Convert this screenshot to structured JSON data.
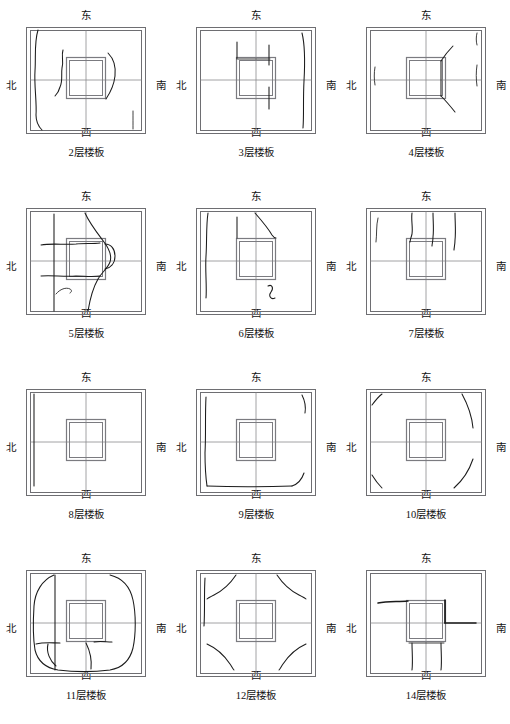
{
  "figure": {
    "type": "floor-slab-crack-diagram-grid",
    "columns": 3,
    "rows": 4,
    "directions": {
      "north_top": "东",
      "south_bottom": "西",
      "west_left": "北",
      "east_right": "南"
    }
  },
  "panels": [
    {
      "id": "panel-2",
      "caption": "2层楼板",
      "floor": 2,
      "direction_top": "东",
      "direction_bottom": "西",
      "direction_left": "北",
      "direction_right": "南",
      "crack_description": "Long wavy crack along north (left) edge, short vertical cracks above and below core, curved crack on south (right) side of core, short mark near bottom-right"
    },
    {
      "id": "panel-3",
      "caption": "3层楼板",
      "floor": 3,
      "direction_top": "东",
      "direction_bottom": "西",
      "direction_left": "北",
      "direction_right": "南",
      "crack_description": "Two straight vertical cracks above core, one vertical crack below core extending south, thin crack along east (right) edge"
    },
    {
      "id": "panel-4",
      "caption": "4层楼板",
      "floor": 4,
      "direction_top": "东",
      "direction_bottom": "西",
      "direction_left": "北",
      "direction_right": "南",
      "crack_description": "Diagonal cracks radiating from the southeast corner of the core toward top-right and bottom-right; faint vertical marks on left and right edges"
    },
    {
      "id": "panel-5",
      "caption": "5层楼板",
      "floor": 5,
      "direction_top": "东",
      "direction_bottom": "西",
      "direction_left": "北",
      "direction_right": "南",
      "crack_description": "Heavy cracking: long diagonal crack from top center sweeping around the east side of the core down to the bottom, horizontal cracks crossing the north half, hooked crack in lower-left quadrant"
    },
    {
      "id": "panel-6",
      "caption": "6层楼板",
      "floor": 6,
      "direction_top": "东",
      "direction_bottom": "西",
      "direction_left": "北",
      "direction_right": "南",
      "crack_description": "Vertical crack above core, curved diagonal crack from top center to core corner, vertical crack along west (left) edge, S-shaped crack below core"
    },
    {
      "id": "panel-7",
      "caption": "7层楼板",
      "floor": 7,
      "direction_top": "东",
      "direction_bottom": "西",
      "direction_left": "北",
      "direction_right": "南",
      "crack_description": "Three near-vertical cracks descending from the top edge into the upper half; thin crack along left edge"
    },
    {
      "id": "panel-8",
      "caption": "8层楼板",
      "floor": 8,
      "direction_top": "东",
      "direction_bottom": "西",
      "direction_left": "北",
      "direction_right": "南",
      "crack_description": "Essentially undamaged; only a thin vertical crack along the north (left) edge"
    },
    {
      "id": "panel-9",
      "caption": "9层楼板",
      "floor": 9,
      "direction_top": "东",
      "direction_bottom": "西",
      "direction_left": "北",
      "direction_right": "南",
      "crack_description": "Light perimeter cracking just inside all four edges, with small arcs at the right corners"
    },
    {
      "id": "panel-10",
      "caption": "10层楼板",
      "floor": 10,
      "direction_top": "东",
      "direction_bottom": "西",
      "direction_left": "北",
      "direction_right": "南",
      "crack_description": "Arc-shaped corner cracks at all four corners, the south (right) arcs being longest"
    },
    {
      "id": "panel-11",
      "caption": "11层楼板",
      "floor": 11,
      "direction_top": "东",
      "direction_bottom": "西",
      "direction_left": "北",
      "direction_right": "南",
      "crack_description": "Large rounded-square crack loop following the slab perimeter, plus horizontal and hooked cracks below the core in the lower-left quadrant"
    },
    {
      "id": "panel-12",
      "caption": "12层楼板",
      "floor": 12,
      "direction_top": "东",
      "direction_bottom": "西",
      "direction_left": "北",
      "direction_right": "南",
      "crack_description": "Symmetric diagonal corner cracks at all four corners; short vertical crack on the west (left) edge"
    },
    {
      "id": "panel-14",
      "caption": "14层楼板",
      "floor": 14,
      "direction_top": "东",
      "direction_bottom": "西",
      "direction_left": "北",
      "direction_right": "南",
      "crack_description": "Thick horizontal crack entering the core from the north (left), heavy crack along the east side of the core, two vertical cracks running south from the core to the bottom edge"
    }
  ],
  "colors": {
    "slab_outline": "#6e6e72",
    "core_outline": "#7b7b80",
    "axis": "#8a8a8e",
    "crack": "#1b1b1b",
    "background": "#ffffff",
    "text": "#111111"
  },
  "geometry": {
    "slab_outer_rect": [
      4,
      4,
      120,
      107
    ],
    "slab_inner_rect": [
      8,
      7,
      112,
      101
    ],
    "core_outer_rect": [
      44,
      34,
      40,
      42
    ],
    "core_inner_rect": [
      47,
      37,
      34,
      36
    ],
    "center_x": 64,
    "center_y": 57
  }
}
